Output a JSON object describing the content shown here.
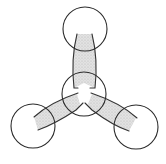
{
  "diagram": {
    "type": "trigonal-planar-orbital-overlap",
    "colors": {
      "background": "#ffffff",
      "outline": "#2a2a2a",
      "shading": "#d6d6d6"
    },
    "atoms": [
      {
        "id": "center",
        "cx": 84,
        "cy": 94,
        "r": 22
      },
      {
        "id": "top",
        "cx": 85,
        "cy": 29,
        "r": 22
      },
      {
        "id": "left",
        "cx": 33,
        "cy": 126,
        "r": 22
      },
      {
        "id": "right",
        "cx": 136,
        "cy": 127,
        "r": 22
      }
    ],
    "bonds": [
      {
        "from": "center",
        "to": "top"
      },
      {
        "from": "center",
        "to": "left"
      },
      {
        "from": "center",
        "to": "right"
      }
    ]
  }
}
